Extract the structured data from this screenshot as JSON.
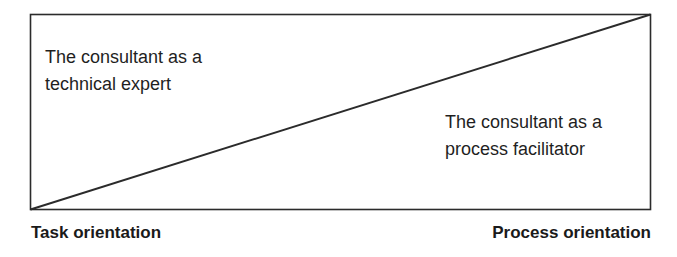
{
  "diagram": {
    "type": "continuum-triangle",
    "regions": [
      {
        "id": "upper-left",
        "lines": [
          "The consultant as a",
          "technical expert"
        ]
      },
      {
        "id": "lower-right",
        "lines": [
          "The consultant as a",
          "process facilitator"
        ]
      }
    ],
    "axis": {
      "left_label": "Task orientation",
      "right_label": "Process orientation"
    },
    "colors": {
      "stroke": "#2b2b2b",
      "text": "#1f1f1f",
      "background": "#ffffff"
    }
  }
}
